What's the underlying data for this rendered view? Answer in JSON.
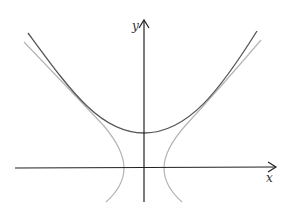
{
  "diagram": {
    "axes": {
      "x_label": "x",
      "y_label": "y",
      "color": "#222222"
    },
    "curves": [
      {
        "name": "catenary-curve",
        "description": "upward U-shaped curve (cosh-like) with minimum above x-axis on y-axis",
        "color": "#555555"
      },
      {
        "name": "hyperbola-curve",
        "description": "two branches opening left/right, vertices on x-axis, asymptotically tangent to the U-shaped curve",
        "color": "#b0b0b0"
      }
    ]
  }
}
